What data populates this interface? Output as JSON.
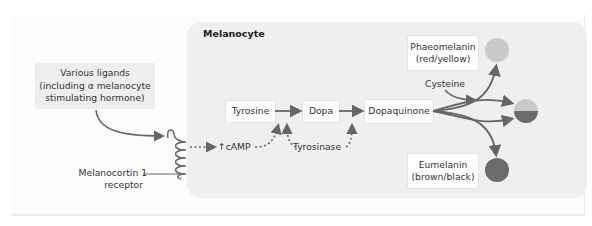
{
  "diagram": {
    "cell_title": "Melanocyte",
    "ligand_box": {
      "line1": "Various ligands",
      "line2": "(including α melanocyte",
      "line3": "stimulating hormone)"
    },
    "receptor_label": {
      "line1": "Melanocortin 1",
      "line2": "receptor"
    },
    "camp_label": "↑cAMP",
    "nodes": {
      "tyrosine": "Tyrosine",
      "dopa": "Dopa",
      "dopaquinone": "Dopaquinone"
    },
    "enzyme_label": "Tyrosinase",
    "cysteine_label": "Cysteine",
    "products": {
      "phaeomelanin": {
        "line1": "Phaeomelanin",
        "line2": "(red/yellow)"
      },
      "eumelanin": {
        "line1": "Eumelanin",
        "line2": "(brown/black)"
      }
    },
    "colors": {
      "phaeomelanin": "#c9c9c9",
      "eumelanin": "#6b6b6b",
      "arrow": "#666666",
      "cell_bg": "#efefef",
      "ligand_bg": "#eeeeee"
    }
  }
}
